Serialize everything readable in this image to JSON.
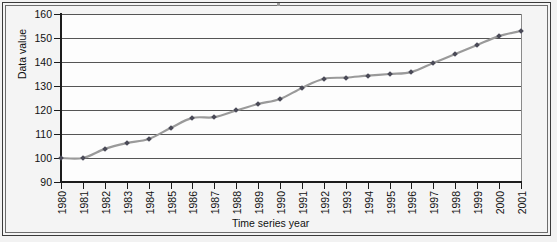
{
  "chart_data": {
    "type": "line",
    "title": "",
    "xlabel": "Time series year",
    "ylabel": "Data value",
    "ylim": [
      90,
      160
    ],
    "yticks": [
      90,
      100,
      110,
      120,
      130,
      140,
      150,
      160
    ],
    "grid": true,
    "legend": null,
    "line_color": "#9a9a9a",
    "marker_color": "#4a4a57",
    "marker_style": "diamond",
    "categories": [
      "1980",
      "1981",
      "1982",
      "1983",
      "1984",
      "1985",
      "1986",
      "1987",
      "1988",
      "1989",
      "1990",
      "1991",
      "1992",
      "1993",
      "1994",
      "1995",
      "1996",
      "1997",
      "1998",
      "1999",
      "2000",
      "2001"
    ],
    "values": [
      100.0,
      100.0,
      103.8,
      106.2,
      107.9,
      112.5,
      116.7,
      117.0,
      119.8,
      122.5,
      124.6,
      129.2,
      133.0,
      133.5,
      134.3,
      135.0,
      135.8,
      139.6,
      143.3,
      147.1,
      150.8,
      152.9
    ],
    "series": [
      {
        "name": "Data value",
        "values": [
          100.0,
          100.0,
          103.8,
          106.2,
          107.9,
          112.5,
          116.7,
          117.0,
          119.8,
          122.5,
          124.6,
          129.2,
          133.0,
          133.5,
          134.3,
          135.0,
          135.8,
          139.6,
          143.3,
          147.1,
          150.8,
          152.9
        ]
      }
    ]
  }
}
